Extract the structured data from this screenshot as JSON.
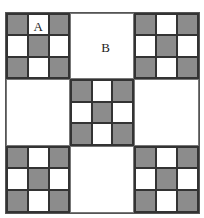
{
  "figure": {
    "colors": {
      "shaded": "#8c8c8c",
      "plain": "#ffffff",
      "line": "#333333"
    },
    "labels": {
      "a": "A",
      "b": "B"
    },
    "blocks": [
      {
        "position": "top-left",
        "type": "checker",
        "label": "A"
      },
      {
        "position": "top-center",
        "type": "plain",
        "label": "B"
      },
      {
        "position": "top-right",
        "type": "checker"
      },
      {
        "position": "middle-left",
        "type": "plain"
      },
      {
        "position": "center",
        "type": "checker"
      },
      {
        "position": "middle-right",
        "type": "plain"
      },
      {
        "position": "bottom-left",
        "type": "checker"
      },
      {
        "position": "bottom-center",
        "type": "plain"
      },
      {
        "position": "bottom-right",
        "type": "checker"
      }
    ],
    "checker_pattern": [
      [
        1,
        0,
        1
      ],
      [
        0,
        1,
        0
      ],
      [
        1,
        0,
        1
      ]
    ]
  }
}
